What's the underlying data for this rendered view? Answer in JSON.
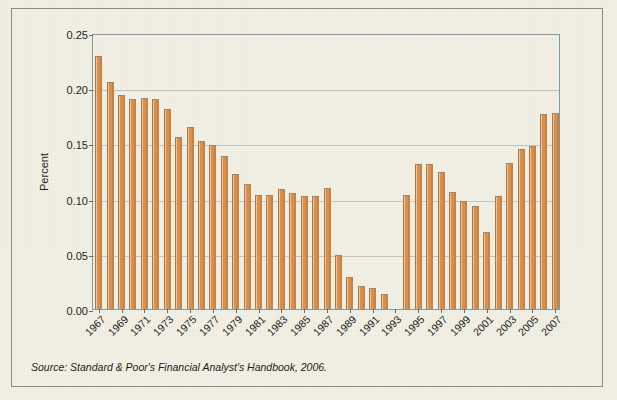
{
  "figure": {
    "background_color": "#f2f0e4",
    "frame_border_color": "#8d8d86",
    "source_note": "Source: Standard & Poor's Financial Analyst's Handbook, 2006."
  },
  "chart_data": {
    "type": "bar",
    "title": "",
    "xlabel": "",
    "ylabel": "Percent",
    "ylim": [
      0.0,
      0.25
    ],
    "ytick_labels": [
      "0.00",
      "0.05",
      "0.10",
      "0.15",
      "0.20",
      "0.25"
    ],
    "ytick_values": [
      0.0,
      0.05,
      0.1,
      0.15,
      0.2,
      0.25
    ],
    "grid": true,
    "legend": "none",
    "bar_color": "#d59155",
    "bar_edge_color": "#8a8a86",
    "xtick_labels": [
      "1967",
      "1969",
      "1971",
      "1973",
      "1975",
      "1977",
      "1979",
      "1981",
      "1983",
      "1985",
      "1987",
      "1989",
      "1991",
      "1993",
      "1995",
      "1997",
      "1999",
      "2001",
      "2003",
      "2005",
      "2007"
    ],
    "categories": [
      "1967",
      "1968",
      "1969",
      "1970",
      "1971",
      "1972",
      "1973",
      "1974",
      "1975",
      "1976",
      "1977",
      "1978",
      "1979",
      "1980",
      "1981",
      "1982",
      "1983",
      "1984",
      "1985",
      "1986",
      "1987",
      "1988",
      "1989",
      "1990",
      "1991",
      "1992",
      "1993",
      "1994",
      "1995",
      "1996",
      "1997",
      "1998",
      "1999",
      "2000",
      "2001",
      "2002",
      "2003",
      "2004",
      "2005",
      "2006",
      "2007"
    ],
    "values": [
      0.229,
      0.206,
      0.194,
      0.19,
      0.191,
      0.19,
      0.181,
      0.156,
      0.165,
      0.152,
      0.149,
      0.139,
      0.122,
      0.113,
      0.103,
      0.103,
      0.109,
      0.105,
      0.102,
      0.102,
      0.11,
      0.049,
      0.029,
      0.021,
      0.019,
      0.014,
      0.0,
      0.103,
      0.131,
      0.131,
      0.124,
      0.106,
      0.098,
      0.093,
      0.07,
      0.102,
      0.132,
      0.145,
      0.148,
      0.177,
      0.178
    ]
  }
}
